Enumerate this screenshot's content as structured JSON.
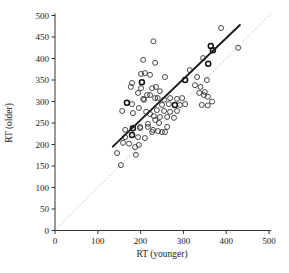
{
  "chart_data": {
    "type": "scatter",
    "title": "",
    "xlabel": "RT (younger)",
    "ylabel": "RT (older)",
    "xlim": [
      0,
      500
    ],
    "ylim": [
      0,
      500
    ],
    "x_ticks": [
      0,
      100,
      200,
      300,
      400,
      500
    ],
    "y_ticks": [
      0,
      50,
      100,
      150,
      200,
      250,
      300,
      350,
      400,
      450,
      500
    ],
    "grid": false,
    "legend": "none",
    "marker": "open-circle",
    "colors": {
      "marker_stroke": "#333333",
      "axis": "#333333",
      "identity_line": "#aaaaaa",
      "regression_line": "#1a1a1a",
      "background": "#ffffff"
    },
    "identity_line": {
      "style": "dotted",
      "from": [
        0,
        0
      ],
      "to": [
        508,
        508
      ]
    },
    "regression_line": {
      "style": "solid",
      "from": [
        135,
        195
      ],
      "to": [
        432,
        478
      ]
    },
    "points": [
      [
        230,
        440
      ],
      [
        388,
        471
      ],
      [
        428,
        425
      ],
      [
        346,
        401
      ],
      [
        206,
        397
      ],
      [
        234,
        390
      ],
      [
        315,
        373
      ],
      [
        201,
        364
      ],
      [
        210,
        366
      ],
      [
        222,
        362
      ],
      [
        257,
        357
      ],
      [
        332,
        357
      ],
      [
        355,
        350
      ],
      [
        180,
        343
      ],
      [
        327,
        338
      ],
      [
        340,
        334
      ],
      [
        177,
        334
      ],
      [
        201,
        331
      ],
      [
        227,
        331
      ],
      [
        236,
        334
      ],
      [
        245,
        324
      ],
      [
        337,
        320
      ],
      [
        348,
        315
      ],
      [
        350,
        322
      ],
      [
        357,
        311
      ],
      [
        367,
        300
      ],
      [
        343,
        292
      ],
      [
        357,
        291
      ],
      [
        194,
        320
      ],
      [
        215,
        315
      ],
      [
        222,
        315
      ],
      [
        234,
        308
      ],
      [
        206,
        306
      ],
      [
        240,
        308
      ],
      [
        255,
        304
      ],
      [
        269,
        308
      ],
      [
        285,
        306
      ],
      [
        297,
        308
      ],
      [
        208,
        304
      ],
      [
        250,
        292
      ],
      [
        266,
        294
      ],
      [
        292,
        292
      ],
      [
        304,
        294
      ],
      [
        180,
        294
      ],
      [
        196,
        285
      ],
      [
        238,
        280
      ],
      [
        255,
        278
      ],
      [
        269,
        276
      ],
      [
        285,
        278
      ],
      [
        157,
        278
      ],
      [
        182,
        273
      ],
      [
        213,
        276
      ],
      [
        222,
        271
      ],
      [
        231,
        266
      ],
      [
        245,
        264
      ],
      [
        262,
        264
      ],
      [
        278,
        262
      ],
      [
        234,
        257
      ],
      [
        243,
        250
      ],
      [
        217,
        248
      ],
      [
        262,
        241
      ],
      [
        199,
        241
      ],
      [
        164,
        234
      ],
      [
        250,
        229
      ],
      [
        227,
        229
      ],
      [
        257,
        229
      ],
      [
        199,
        238
      ],
      [
        217,
        241
      ],
      [
        229,
        234
      ],
      [
        241,
        231
      ],
      [
        164,
        217
      ],
      [
        194,
        217
      ],
      [
        210,
        215
      ],
      [
        159,
        204
      ],
      [
        173,
        202
      ],
      [
        187,
        194
      ],
      [
        196,
        199
      ],
      [
        189,
        176
      ],
      [
        145,
        180
      ],
      [
        154,
        152
      ]
    ],
    "dark_points": [
      [
        364,
        429
      ],
      [
        369,
        419
      ],
      [
        358,
        388
      ],
      [
        304,
        350
      ],
      [
        203,
        345
      ],
      [
        280,
        292
      ],
      [
        168,
        297
      ],
      [
        182,
        238
      ],
      [
        180,
        222
      ]
    ]
  }
}
